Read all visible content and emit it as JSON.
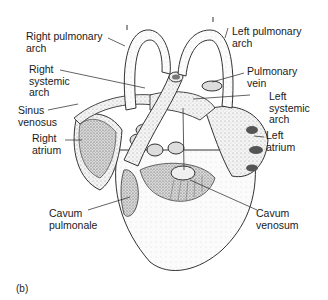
{
  "figure": {
    "panel_label": "(b)"
  },
  "labels": {
    "right_pulmonary_arch": "Right pulmonary\narch",
    "left_pulmonary_arch": "Left pulmonary\narch",
    "right_systemic_arch": "Right\nsystemic\narch",
    "pulmonary_vein": "Pulmonary\nvein",
    "sinus_venosus": "Sinus\nvenosus",
    "left_systemic_arch": "Left\nsystemic\narch",
    "right_atrium": "Right\natrium",
    "left_atrium": "Left\natrium",
    "cavum_pulmonale": "Cavum\npulmonale",
    "cavum_venosum": "Cavum\nvenosum"
  }
}
